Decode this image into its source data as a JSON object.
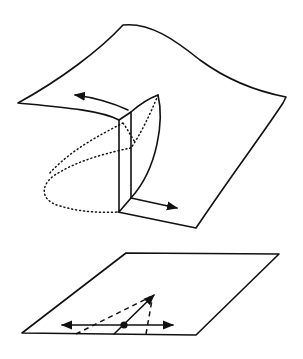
{
  "diagram": {
    "type": "geometric illustration",
    "colors": {
      "stroke": "#111111",
      "background": "#ffffff"
    },
    "upper_figure": {
      "name": "curved-surface-with-fold",
      "elements": [
        "surface-outline",
        "fold-slab",
        "curved-fold-edge",
        "dotted-hidden-curve",
        "left-arrow",
        "right-arrow"
      ]
    },
    "lower_figure": {
      "name": "tangent-plane",
      "elements": [
        "plane-outline",
        "base-point",
        "horizontal-double-arrow",
        "solid-diagonal-arrow",
        "dashed-cone-lines"
      ]
    }
  }
}
